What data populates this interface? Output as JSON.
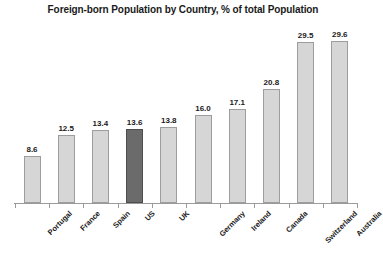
{
  "chart_data": {
    "type": "bar",
    "title": "Foreign-born Population by Country, % of total Population",
    "xlabel": "",
    "ylabel": "",
    "ylim": [
      0,
      32
    ],
    "grid": false,
    "legend": "none",
    "categories": [
      "Portugal",
      "France",
      "Spain",
      "US",
      "UK",
      "Germany",
      "Ireland",
      "Canada",
      "Switzerland",
      "Australia"
    ],
    "values": [
      8.6,
      12.5,
      13.4,
      13.6,
      13.8,
      16.0,
      17.1,
      20.8,
      29.5,
      29.6
    ],
    "value_labels": [
      "8.6",
      "12.5",
      "13.4",
      "13.6",
      "13.8",
      "16.0",
      "17.1",
      "20.8",
      "29.5",
      "29.6"
    ],
    "highlight_category": "US",
    "colors": {
      "bar_fill": "#d6d6d6",
      "bar_outline": "#9d9d9d",
      "highlight_fill": "#6b6b6b",
      "highlight_outline": "#4d4d4d",
      "axis": "#9a9a9a",
      "text": "#1a1a1a",
      "background": "#ffffff"
    }
  }
}
